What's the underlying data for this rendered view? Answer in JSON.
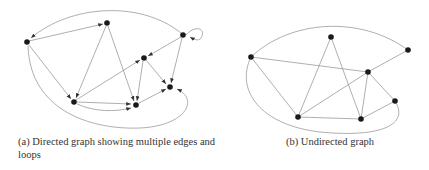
{
  "figures": [
    {
      "id": "a",
      "caption": "(a) Directed graph showing multiple edges and loops",
      "caption_line1": "(a) Directed graph showing multiple edges and",
      "caption_line2": "loops",
      "type": "directed",
      "nodes": [
        {
          "id": "A",
          "x": 27,
          "y": 42
        },
        {
          "id": "B",
          "x": 107,
          "y": 23
        },
        {
          "id": "C",
          "x": 183,
          "y": 35
        },
        {
          "id": "D",
          "x": 144,
          "y": 58
        },
        {
          "id": "E",
          "x": 170,
          "y": 87
        },
        {
          "id": "F",
          "x": 74,
          "y": 102
        },
        {
          "id": "G",
          "x": 136,
          "y": 105
        }
      ],
      "edges": [
        {
          "from": "A",
          "to": "B"
        },
        {
          "from": "C",
          "to": "A",
          "curved": true
        },
        {
          "from": "C",
          "to": "C",
          "loop": true
        },
        {
          "from": "A",
          "to": "F"
        },
        {
          "from": "A",
          "to": "E",
          "curved": true
        },
        {
          "from": "B",
          "to": "F"
        },
        {
          "from": "B",
          "to": "G"
        },
        {
          "from": "C",
          "to": "D"
        },
        {
          "from": "C",
          "to": "E"
        },
        {
          "from": "F",
          "to": "D"
        },
        {
          "from": "D",
          "to": "G"
        },
        {
          "from": "D",
          "to": "E"
        },
        {
          "from": "F",
          "to": "G"
        },
        {
          "from": "F",
          "to": "G",
          "curved": true
        },
        {
          "from": "G",
          "to": "E"
        }
      ]
    },
    {
      "id": "b",
      "caption": "(b) Undirected graph",
      "type": "undirected",
      "nodes": [
        {
          "id": "a",
          "x": 251,
          "y": 57
        },
        {
          "id": "b",
          "x": 331,
          "y": 37
        },
        {
          "id": "c",
          "x": 408,
          "y": 50
        },
        {
          "id": "d",
          "x": 368,
          "y": 72
        },
        {
          "id": "e",
          "x": 395,
          "y": 101
        },
        {
          "id": "f",
          "x": 298,
          "y": 117
        },
        {
          "id": "g",
          "x": 361,
          "y": 119
        }
      ],
      "edges": [
        {
          "from": "a",
          "to": "c",
          "curved": true
        },
        {
          "from": "a",
          "to": "d"
        },
        {
          "from": "a",
          "to": "f"
        },
        {
          "from": "a",
          "to": "e",
          "curved": true
        },
        {
          "from": "b",
          "to": "f"
        },
        {
          "from": "b",
          "to": "g"
        },
        {
          "from": "c",
          "to": "d"
        },
        {
          "from": "d",
          "to": "f"
        },
        {
          "from": "d",
          "to": "g"
        },
        {
          "from": "d",
          "to": "e"
        },
        {
          "from": "f",
          "to": "g"
        },
        {
          "from": "g",
          "to": "e"
        }
      ]
    }
  ]
}
